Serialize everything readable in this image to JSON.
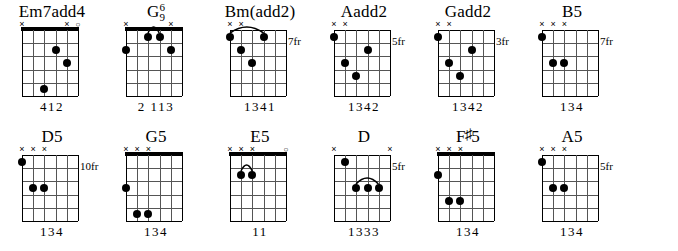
{
  "chart_data": {
    "type": "table",
    "notation": {
      "open_marker": "o",
      "muted_marker": "×",
      "fret_suffix": "fr",
      "strings": 6,
      "frets": 5
    },
    "rows": [
      {
        "chords": [
          {
            "name": "Em7add4",
            "name_parts": {
              "base": "Em7add4",
              "sup": "",
              "sub": ""
            },
            "position_label": "",
            "open_nut": true,
            "string_markers": [
              "x",
              "",
              "",
              "",
              "x",
              "o"
            ],
            "dots": [
              {
                "string": 3,
                "fret": 2
              },
              {
                "string": 2,
                "fret": 3
              },
              {
                "string": 4,
                "fret": 5
              }
            ],
            "barres": [],
            "fingering": "412"
          },
          {
            "name": "G6/9",
            "name_parts": {
              "base": "G",
              "sup": "6",
              "sub": "9"
            },
            "position_label": "",
            "open_nut": true,
            "string_markers": [
              "x",
              "",
              "",
              "",
              "x",
              ""
            ],
            "dots": [
              {
                "string": 6,
                "fret": 2
              },
              {
                "string": 4,
                "fret": 1
              },
              {
                "string": 3,
                "fret": 1
              },
              {
                "string": 2,
                "fret": 2
              }
            ],
            "barres": [
              {
                "fret": 1,
                "from_string": 4,
                "to_string": 3
              }
            ],
            "fingering": "2 113"
          },
          {
            "name": "Bm(add2)",
            "name_parts": {
              "base": "Bm(add2)",
              "sup": "",
              "sub": ""
            },
            "position_label": "7fr",
            "open_nut": false,
            "string_markers": [
              "x",
              "x",
              "",
              "",
              "",
              ""
            ],
            "dots": [
              {
                "string": 6,
                "fret": 1
              },
              {
                "string": 3,
                "fret": 1
              },
              {
                "string": 5,
                "fret": 2
              },
              {
                "string": 4,
                "fret": 3
              }
            ],
            "barres": [
              {
                "fret": 1,
                "from_string": 6,
                "to_string": 3
              }
            ],
            "fingering": "1341"
          },
          {
            "name": "Aadd2",
            "name_parts": {
              "base": "Aadd2",
              "sup": "",
              "sub": ""
            },
            "position_label": "5fr",
            "open_nut": false,
            "string_markers": [
              "x",
              "x",
              "",
              "",
              "",
              ""
            ],
            "dots": [
              {
                "string": 6,
                "fret": 1
              },
              {
                "string": 3,
                "fret": 2
              },
              {
                "string": 5,
                "fret": 3
              },
              {
                "string": 4,
                "fret": 4
              }
            ],
            "barres": [],
            "fingering": "1342"
          },
          {
            "name": "Gadd2",
            "name_parts": {
              "base": "Gadd2",
              "sup": "",
              "sub": ""
            },
            "position_label": "3fr",
            "open_nut": false,
            "string_markers": [
              "x",
              "x",
              "",
              "",
              "",
              ""
            ],
            "dots": [
              {
                "string": 6,
                "fret": 1
              },
              {
                "string": 3,
                "fret": 2
              },
              {
                "string": 5,
                "fret": 3
              },
              {
                "string": 4,
                "fret": 4
              }
            ],
            "barres": [],
            "fingering": "1342"
          },
          {
            "name": "B5",
            "name_parts": {
              "base": "B5",
              "sup": "",
              "sub": ""
            },
            "position_label": "7fr",
            "open_nut": false,
            "string_markers": [
              "x",
              "x",
              "x",
              "",
              "",
              ""
            ],
            "dots": [
              {
                "string": 6,
                "fret": 1
              },
              {
                "string": 5,
                "fret": 3
              },
              {
                "string": 4,
                "fret": 3
              }
            ],
            "barres": [],
            "fingering": "134"
          }
        ]
      },
      {
        "chords": [
          {
            "name": "D5",
            "name_parts": {
              "base": "D5",
              "sup": "",
              "sub": ""
            },
            "position_label": "10fr",
            "open_nut": false,
            "string_markers": [
              "x",
              "x",
              "x",
              "",
              "",
              ""
            ],
            "dots": [
              {
                "string": 6,
                "fret": 1
              },
              {
                "string": 5,
                "fret": 3
              },
              {
                "string": 4,
                "fret": 3
              }
            ],
            "barres": [],
            "fingering": "134"
          },
          {
            "name": "G5",
            "name_parts": {
              "base": "G5",
              "sup": "",
              "sub": ""
            },
            "position_label": "",
            "open_nut": true,
            "string_markers": [
              "x",
              "x",
              "x",
              "",
              "",
              ""
            ],
            "dots": [
              {
                "string": 6,
                "fret": 3
              },
              {
                "string": 5,
                "fret": 5
              },
              {
                "string": 4,
                "fret": 5
              }
            ],
            "barres": [],
            "fingering": "134"
          },
          {
            "name": "E5",
            "name_parts": {
              "base": "E5",
              "sup": "",
              "sub": ""
            },
            "position_label": "",
            "open_nut": true,
            "string_markers": [
              "x",
              "x",
              "x",
              "",
              "",
              "o"
            ],
            "dots": [
              {
                "string": 5,
                "fret": 2
              },
              {
                "string": 4,
                "fret": 2
              }
            ],
            "barres": [
              {
                "fret": 2,
                "from_string": 5,
                "to_string": 4
              }
            ],
            "fingering": "11"
          },
          {
            "name": "D",
            "name_parts": {
              "base": "D",
              "sup": "",
              "sub": ""
            },
            "position_label": "5fr",
            "open_nut": false,
            "string_markers": [
              "x",
              "",
              "",
              "",
              "",
              "x"
            ],
            "dots": [
              {
                "string": 5,
                "fret": 1
              },
              {
                "string": 4,
                "fret": 3
              },
              {
                "string": 3,
                "fret": 3
              },
              {
                "string": 2,
                "fret": 3
              }
            ],
            "barres": [
              {
                "fret": 3,
                "from_string": 4,
                "to_string": 2
              }
            ],
            "fingering": "1333"
          },
          {
            "name": "F#5",
            "name_parts": {
              "base": "F",
              "sup": "",
              "sub": "",
              "accidental": "♯",
              "tail": "5"
            },
            "position_label": "",
            "open_nut": true,
            "string_markers": [
              "x",
              "x",
              "x",
              "",
              "",
              ""
            ],
            "dots": [
              {
                "string": 6,
                "fret": 2
              },
              {
                "string": 5,
                "fret": 4
              },
              {
                "string": 4,
                "fret": 4
              }
            ],
            "barres": [],
            "fingering": "134"
          },
          {
            "name": "A5",
            "name_parts": {
              "base": "A5",
              "sup": "",
              "sub": ""
            },
            "position_label": "5fr",
            "open_nut": false,
            "string_markers": [
              "x",
              "x",
              "x",
              "",
              "",
              ""
            ],
            "dots": [
              {
                "string": 6,
                "fret": 1
              },
              {
                "string": 5,
                "fret": 3
              },
              {
                "string": 4,
                "fret": 3
              }
            ],
            "barres": [],
            "fingering": "134"
          }
        ]
      }
    ]
  }
}
